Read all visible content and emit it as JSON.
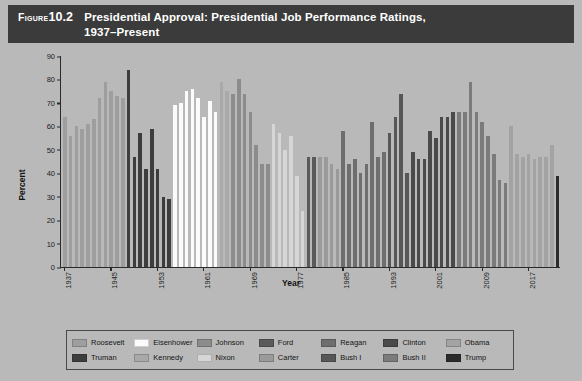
{
  "figure": {
    "label": "Figure",
    "number": "10.2",
    "title_line1": "Presidential Approval: Presidential Job Performance Ratings,",
    "title_line2": "1937–Present"
  },
  "colors": {
    "background": "#b9b9b9",
    "title_bar": "#3b3b3b",
    "axis": "#2a2a2a",
    "legend_border": "#4a4a4a"
  },
  "chart_data": {
    "type": "bar",
    "title": "Presidential Approval: Presidential Job Performance Ratings, 1937–Present",
    "xlabel": "Year",
    "ylabel": "Percent",
    "ylim": [
      0,
      90
    ],
    "yticks": [
      0,
      10,
      20,
      30,
      40,
      50,
      60,
      70,
      80,
      90
    ],
    "xticks": [
      1937,
      1945,
      1953,
      1961,
      1969,
      1977,
      1985,
      1993,
      2001,
      2009,
      2017
    ],
    "grid": false,
    "legend_position": "bottom",
    "series": [
      {
        "name": "Roosevelt",
        "color": "#9e9e9e"
      },
      {
        "name": "Truman",
        "color": "#3d3d3d"
      },
      {
        "name": "Eisenhower",
        "color": "#fbfbfb"
      },
      {
        "name": "Kennedy",
        "color": "#a9a9a9"
      },
      {
        "name": "Johnson",
        "color": "#8c8c8c"
      },
      {
        "name": "Nixon",
        "color": "#d6d6d6"
      },
      {
        "name": "Ford",
        "color": "#5a5a5a"
      },
      {
        "name": "Carter",
        "color": "#9a9a9a"
      },
      {
        "name": "Reagan",
        "color": "#6e6e6e"
      },
      {
        "name": "Bush I",
        "color": "#575757"
      },
      {
        "name": "Clinton",
        "color": "#4a4a4a"
      },
      {
        "name": "Bush II",
        "color": "#7b7b7b"
      },
      {
        "name": "Obama",
        "color": "#a3a3a3"
      },
      {
        "name": "Trump",
        "color": "#2b2b2b"
      }
    ],
    "points": [
      {
        "year": 1937,
        "value": 64,
        "president": "Roosevelt"
      },
      {
        "year": 1938,
        "value": 56,
        "president": "Roosevelt"
      },
      {
        "year": 1939,
        "value": 60,
        "president": "Roosevelt"
      },
      {
        "year": 1940,
        "value": 59,
        "president": "Roosevelt"
      },
      {
        "year": 1941,
        "value": 61,
        "president": "Roosevelt"
      },
      {
        "year": 1942,
        "value": 63,
        "president": "Roosevelt"
      },
      {
        "year": 1943,
        "value": 72,
        "president": "Roosevelt"
      },
      {
        "year": 1944,
        "value": 79,
        "president": "Roosevelt"
      },
      {
        "year": 1945,
        "value": 75,
        "president": "Roosevelt"
      },
      {
        "year": 1946,
        "value": 73,
        "president": "Roosevelt"
      },
      {
        "year": 1947,
        "value": 72,
        "president": "Roosevelt"
      },
      {
        "year": 1948,
        "value": 84,
        "president": "Truman"
      },
      {
        "year": 1949,
        "value": 47,
        "president": "Truman"
      },
      {
        "year": 1950,
        "value": 57,
        "president": "Truman"
      },
      {
        "year": 1951,
        "value": 42,
        "president": "Truman"
      },
      {
        "year": 1952,
        "value": 59,
        "president": "Truman"
      },
      {
        "year": 1953,
        "value": 42,
        "president": "Truman"
      },
      {
        "year": 1954,
        "value": 30,
        "president": "Truman"
      },
      {
        "year": 1955,
        "value": 29,
        "president": "Truman"
      },
      {
        "year": 1956,
        "value": 69,
        "president": "Eisenhower"
      },
      {
        "year": 1957,
        "value": 70,
        "president": "Eisenhower"
      },
      {
        "year": 1958,
        "value": 75,
        "president": "Eisenhower"
      },
      {
        "year": 1959,
        "value": 76,
        "president": "Eisenhower"
      },
      {
        "year": 1960,
        "value": 72,
        "president": "Eisenhower"
      },
      {
        "year": 1961,
        "value": 64,
        "president": "Eisenhower"
      },
      {
        "year": 1962,
        "value": 71,
        "president": "Eisenhower"
      },
      {
        "year": 1963,
        "value": 66,
        "president": "Eisenhower"
      },
      {
        "year": 1964,
        "value": 79,
        "president": "Kennedy"
      },
      {
        "year": 1965,
        "value": 75,
        "president": "Kennedy"
      },
      {
        "year": 1966,
        "value": 74,
        "president": "Johnson"
      },
      {
        "year": 1967,
        "value": 80,
        "president": "Johnson"
      },
      {
        "year": 1968,
        "value": 74,
        "president": "Johnson"
      },
      {
        "year": 1969,
        "value": 66,
        "president": "Johnson"
      },
      {
        "year": 1970,
        "value": 52,
        "president": "Johnson"
      },
      {
        "year": 1971,
        "value": 44,
        "president": "Johnson"
      },
      {
        "year": 1972,
        "value": 44,
        "president": "Johnson"
      },
      {
        "year": 1973,
        "value": 61,
        "president": "Nixon"
      },
      {
        "year": 1974,
        "value": 57,
        "president": "Nixon"
      },
      {
        "year": 1975,
        "value": 50,
        "president": "Nixon"
      },
      {
        "year": 1976,
        "value": 56,
        "president": "Nixon"
      },
      {
        "year": 1977,
        "value": 39,
        "president": "Nixon"
      },
      {
        "year": 1978,
        "value": 24,
        "president": "Nixon"
      },
      {
        "year": 1979,
        "value": 47,
        "president": "Ford"
      },
      {
        "year": 1980,
        "value": 47,
        "president": "Ford"
      },
      {
        "year": 1981,
        "value": 47,
        "president": "Carter"
      },
      {
        "year": 1982,
        "value": 47,
        "president": "Carter"
      },
      {
        "year": 1983,
        "value": 44,
        "president": "Carter"
      },
      {
        "year": 1984,
        "value": 42,
        "president": "Carter"
      },
      {
        "year": 1985,
        "value": 58,
        "president": "Reagan"
      },
      {
        "year": 1986,
        "value": 44,
        "president": "Reagan"
      },
      {
        "year": 1987,
        "value": 46,
        "president": "Reagan"
      },
      {
        "year": 1988,
        "value": 40,
        "president": "Reagan"
      },
      {
        "year": 1989,
        "value": 44,
        "president": "Reagan"
      },
      {
        "year": 1990,
        "value": 62,
        "president": "Reagan"
      },
      {
        "year": 1991,
        "value": 47,
        "president": "Reagan"
      },
      {
        "year": 1992,
        "value": 49,
        "president": "Reagan"
      },
      {
        "year": 1993,
        "value": 57,
        "president": "Bush I"
      },
      {
        "year": 1994,
        "value": 64,
        "president": "Bush I"
      },
      {
        "year": 1995,
        "value": 74,
        "president": "Bush I"
      },
      {
        "year": 1996,
        "value": 40,
        "president": "Bush I"
      },
      {
        "year": 1997,
        "value": 49,
        "president": "Clinton"
      },
      {
        "year": 1998,
        "value": 46,
        "president": "Clinton"
      },
      {
        "year": 1999,
        "value": 46,
        "president": "Clinton"
      },
      {
        "year": 2000,
        "value": 58,
        "president": "Clinton"
      },
      {
        "year": 2001,
        "value": 55,
        "president": "Clinton"
      },
      {
        "year": 2002,
        "value": 64,
        "president": "Clinton"
      },
      {
        "year": 2003,
        "value": 64,
        "president": "Clinton"
      },
      {
        "year": 2004,
        "value": 66,
        "president": "Clinton"
      },
      {
        "year": 2005,
        "value": 66,
        "president": "Bush II"
      },
      {
        "year": 2006,
        "value": 66,
        "president": "Bush II"
      },
      {
        "year": 2007,
        "value": 79,
        "president": "Bush II"
      },
      {
        "year": 2008,
        "value": 66,
        "president": "Bush II"
      },
      {
        "year": 2009,
        "value": 62,
        "president": "Bush II"
      },
      {
        "year": 2010,
        "value": 56,
        "president": "Bush II"
      },
      {
        "year": 2011,
        "value": 48,
        "president": "Bush II"
      },
      {
        "year": 2012,
        "value": 37,
        "president": "Bush II"
      },
      {
        "year": 2013,
        "value": 36,
        "president": "Bush II"
      },
      {
        "year": 2014,
        "value": 60,
        "president": "Obama"
      },
      {
        "year": 2015,
        "value": 48,
        "president": "Obama"
      },
      {
        "year": 2016,
        "value": 47,
        "president": "Obama"
      },
      {
        "year": 2017,
        "value": 48,
        "president": "Obama"
      },
      {
        "year": 2018,
        "value": 46,
        "president": "Obama"
      },
      {
        "year": 2019,
        "value": 47,
        "president": "Obama"
      },
      {
        "year": 2020,
        "value": 47,
        "president": "Obama"
      },
      {
        "year": 2021,
        "value": 52,
        "president": "Obama"
      },
      {
        "year": 2022,
        "value": 39,
        "president": "Trump"
      }
    ]
  }
}
